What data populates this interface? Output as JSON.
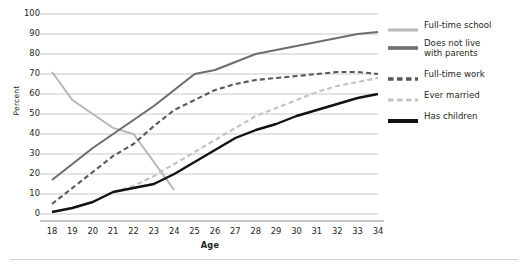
{
  "chart_data": {
    "type": "line",
    "title": "",
    "xlabel": "Age",
    "ylabel": "Percent",
    "x": [
      18,
      19,
      20,
      21,
      22,
      23,
      24,
      25,
      26,
      27,
      28,
      29,
      30,
      31,
      32,
      33,
      34
    ],
    "xlim": [
      18,
      34
    ],
    "ylim": [
      0,
      100
    ],
    "ytick_values": [
      0,
      10,
      20,
      30,
      40,
      50,
      60,
      70,
      80,
      90,
      100
    ],
    "xtick_labels": [
      "18",
      "19",
      "20",
      "21",
      "22",
      "23",
      "24",
      "25",
      "26",
      "27",
      "28",
      "29",
      "30",
      "31",
      "32",
      "33",
      "34"
    ],
    "ytick_labels": [
      "0",
      "10",
      "20",
      "30",
      "40",
      "50",
      "60",
      "70",
      "80",
      "90",
      "100"
    ],
    "grid": "horizontal",
    "legend_position": "right",
    "series": [
      {
        "name": "Full-time school",
        "color": "#b8b8b8",
        "style": "solid",
        "width": 2.1,
        "x": [
          18,
          19,
          20,
          21,
          22,
          23,
          24
        ],
        "values": [
          71,
          57,
          50,
          43,
          40,
          26,
          12
        ]
      },
      {
        "name": "Does not live with parents",
        "color": "#6d6d6d",
        "style": "solid",
        "width": 2.1,
        "x": [
          18,
          19,
          20,
          21,
          22,
          23,
          24,
          25,
          26,
          27,
          28,
          29,
          30,
          31,
          32,
          33,
          34
        ],
        "values": [
          17,
          25,
          33,
          40,
          47,
          54,
          62,
          70,
          72,
          76,
          80,
          82,
          84,
          86,
          88,
          90,
          91
        ]
      },
      {
        "name": "Full-time work",
        "color": "#585858",
        "style": "dashed",
        "width": 2.1,
        "x": [
          18,
          19,
          20,
          21,
          22,
          23,
          24,
          25,
          26,
          27,
          28,
          29,
          30,
          31,
          32,
          33,
          34
        ],
        "values": [
          5,
          13,
          21,
          29,
          35,
          44,
          52,
          57,
          62,
          65,
          67,
          68,
          69,
          70,
          71,
          71,
          70
        ]
      },
      {
        "name": "Ever married",
        "color": "#c2c2c2",
        "style": "dashed",
        "width": 2.1,
        "x": [
          18,
          19,
          20,
          21,
          22,
          23,
          24,
          25,
          26,
          27,
          28,
          29,
          30,
          31,
          32,
          33,
          34
        ],
        "values": [
          1,
          3,
          6,
          11,
          14,
          19,
          25,
          31,
          37,
          43,
          49,
          53,
          57,
          61,
          64,
          66,
          68
        ]
      },
      {
        "name": "Has children",
        "color": "#111111",
        "style": "solid",
        "width": 2.4,
        "x": [
          18,
          19,
          20,
          21,
          22,
          23,
          24,
          25,
          26,
          27,
          28,
          29,
          30,
          31,
          32,
          33,
          34
        ],
        "values": [
          1,
          3,
          6,
          11,
          13,
          15,
          20,
          26,
          32,
          38,
          42,
          45,
          49,
          52,
          55,
          58,
          60
        ]
      }
    ],
    "legend_entries": [
      {
        "label": "Full-time school",
        "color": "#b8b8b8",
        "style": "solid",
        "thickness": 3
      },
      {
        "label": "Does not live\nwith parents",
        "color": "#6d6d6d",
        "style": "solid",
        "thickness": 3.6
      },
      {
        "label": "Full-time work",
        "color": "#585858",
        "style": "dashed",
        "thickness": 3.6
      },
      {
        "label": "Ever married",
        "color": "#c2c2c2",
        "style": "dashed",
        "thickness": 3
      },
      {
        "label": "Has children",
        "color": "#111111",
        "style": "solid",
        "thickness": 4
      }
    ]
  },
  "axes": {
    "gridline_color": "#c9c9c9",
    "axis_color": "#8c8c8c"
  }
}
